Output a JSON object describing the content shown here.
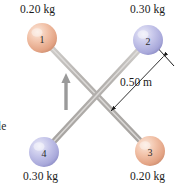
{
  "figure": {
    "background_color": "#ffffff",
    "rod_color": "#b5b2af",
    "width": 188,
    "height": 187
  },
  "balls": [
    {
      "id": "ball-1",
      "number": "1",
      "mass_label": "0.20 kg",
      "color": "#efb99f",
      "highlight_color": "#fae4d6",
      "shade_color": "#d08f72",
      "cx": 42,
      "cy": 38,
      "r": 15,
      "label_x": 20,
      "label_y": 3
    },
    {
      "id": "ball-2",
      "number": "2",
      "mass_label": "0.30 kg",
      "color": "#bcbce4",
      "highlight_color": "#e3e3f6",
      "shade_color": "#8f8fcb",
      "cx": 148,
      "cy": 40,
      "r": 15,
      "label_x": 130,
      "label_y": 3
    },
    {
      "id": "ball-3",
      "number": "3",
      "mass_label": "0.20 kg",
      "color": "#efb99f",
      "highlight_color": "#fae4d6",
      "shade_color": "#d08f72",
      "cx": 150,
      "cy": 151,
      "r": 15,
      "label_x": 130,
      "label_y": 170
    },
    {
      "id": "ball-4",
      "number": "4",
      "mass_label": "0.30 kg",
      "color": "#bcbce4",
      "highlight_color": "#e3e3f6",
      "shade_color": "#8f8fcb",
      "cx": 44,
      "cy": 152,
      "r": 15,
      "label_x": 23,
      "label_y": 170
    }
  ],
  "rods": [
    {
      "id": "rod-1-3",
      "x1": 42,
      "y1": 38,
      "x2": 150,
      "y2": 151
    },
    {
      "id": "rod-2-4",
      "x1": 148,
      "y1": 40,
      "x2": 44,
      "y2": 152
    }
  ],
  "dimension": {
    "label": "0.50 m",
    "label_x": 120,
    "label_y": 76,
    "arrow_x1": 163,
    "arrow_y1": 57,
    "arrow_x2": 111,
    "arrow_y2": 111,
    "tick_x1": 155,
    "tick_y1": 45,
    "tick_x2": 174,
    "tick_y2": 66
  },
  "rotation_arrow": {
    "id": "rotation-direction-arrow",
    "x": 66,
    "y_tail": 110,
    "y_head": 75,
    "color": "#9a9a9a"
  },
  "edge_text": {
    "value": "le",
    "x": -2,
    "y": 120
  }
}
